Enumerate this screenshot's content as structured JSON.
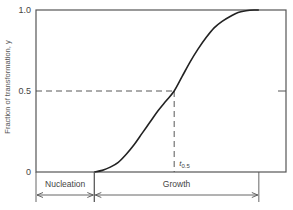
{
  "chart_data": {
    "type": "line",
    "title": "",
    "xlabel": "",
    "ylabel": "Fraction of transformation, y",
    "ylim": [
      0,
      1.0
    ],
    "xlim": [
      -0.73,
      2.4
    ],
    "yticks": [
      {
        "value": 0,
        "label": "0"
      },
      {
        "value": 0.5,
        "label": "0.5"
      },
      {
        "value": 1.0,
        "label": "1.0"
      }
    ],
    "grid": false,
    "series": [
      {
        "name": "Transformation curve",
        "x": [
          0,
          0.1,
          0.2,
          0.3,
          0.4,
          0.5,
          0.6,
          0.7,
          0.8,
          0.9,
          1.0,
          1.1,
          1.2,
          1.3,
          1.4,
          1.5,
          1.6,
          1.7,
          1.8,
          1.9,
          2.0,
          2.06
        ],
        "y": [
          0,
          0.01,
          0.03,
          0.06,
          0.11,
          0.17,
          0.24,
          0.31,
          0.38,
          0.44,
          0.5,
          0.59,
          0.68,
          0.76,
          0.83,
          0.89,
          0.93,
          0.96,
          0.985,
          0.995,
          1.0,
          1.0
        ]
      }
    ],
    "annotations": [
      {
        "text": "t",
        "subscript": "0.5",
        "x": 1.0,
        "y": 0.5,
        "kind": "half-point guide (dashed lines to axes)"
      }
    ],
    "phases": [
      {
        "label": "Nucleation",
        "x_start": -0.73,
        "x_end": 0
      },
      {
        "label": "Growth",
        "x_start": 0,
        "x_end": 2.06
      }
    ]
  }
}
